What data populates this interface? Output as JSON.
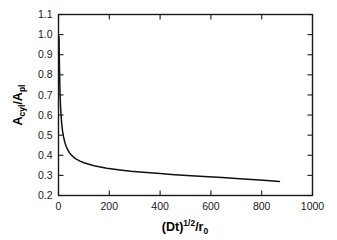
{
  "chart_data": {
    "type": "line",
    "title": "",
    "xlabel": "(Dt)^1/2 / r_0",
    "ylabel": "A_cyl / A_pl",
    "xlim": [
      0,
      1000
    ],
    "ylim": [
      0.2,
      1.1
    ],
    "grid": false,
    "legend": null,
    "x_ticks": [
      0,
      200,
      400,
      600,
      800,
      1000
    ],
    "x_tick_labels": [
      "0",
      "200",
      "400",
      "600",
      "800",
      "1000"
    ],
    "y_ticks": [
      0.2,
      0.3,
      0.4,
      0.5,
      0.6,
      0.7,
      0.8,
      0.9,
      1.0,
      1.1
    ],
    "y_tick_labels": [
      "0.2",
      "0.3",
      "0.4",
      "0.5",
      "0.6",
      "0.7",
      "0.8",
      "0.9",
      "1.0",
      "1.1"
    ],
    "series": [
      {
        "name": "Acyl/Apl",
        "color": "#111111",
        "x": [
          2,
          3,
          4,
          5,
          6,
          8,
          10,
          13,
          16,
          20,
          25,
          30,
          36,
          43,
          50,
          60,
          70,
          85,
          100,
          120,
          140,
          165,
          190,
          220,
          250,
          285,
          320,
          360,
          400,
          445,
          490,
          540,
          590,
          645,
          700,
          760,
          820,
          870
        ],
        "y": [
          0.99,
          0.9,
          0.82,
          0.76,
          0.71,
          0.645,
          0.6,
          0.553,
          0.52,
          0.491,
          0.464,
          0.445,
          0.428,
          0.413,
          0.402,
          0.39,
          0.381,
          0.371,
          0.363,
          0.355,
          0.348,
          0.342,
          0.336,
          0.331,
          0.326,
          0.321,
          0.317,
          0.313,
          0.309,
          0.305,
          0.301,
          0.297,
          0.293,
          0.289,
          0.285,
          0.28,
          0.275,
          0.27
        ]
      }
    ]
  },
  "axis_titles": {
    "y_main": "A",
    "y_sub1": "cyl",
    "y_slash": "/A",
    "y_sub2": "pl",
    "x_main": "(Dt)",
    "x_sup": "1/2",
    "x_slash": "/r",
    "x_sub": "0"
  }
}
